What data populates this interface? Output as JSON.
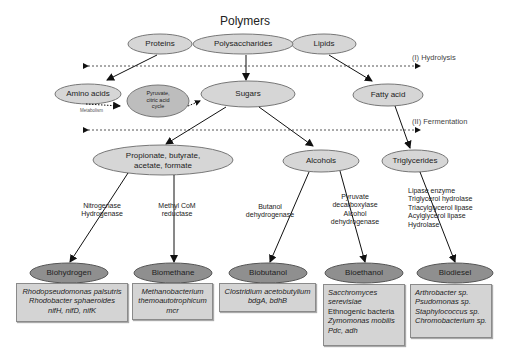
{
  "title": "Polymers",
  "polymers": {
    "proteins": "Proteins",
    "polysaccharides": "Polysaccharides",
    "lipids": "Lipids"
  },
  "stages": {
    "hydrolysis": "(I) Hydrolysis",
    "fermentation": "(II) Fermentation"
  },
  "intermediates": {
    "amino_acids": "Amino acids",
    "pyruvate": [
      "Pyruvate,",
      "citric acid",
      "cycle"
    ],
    "metabolism": "Metabolism",
    "sugars": "Sugars",
    "fatty_acid": "Fatty acid",
    "acids": [
      "Propionate, butyrate,",
      "acetate, formate"
    ],
    "alcohols": "Alcohols",
    "triglycerides": "Triglycerides"
  },
  "enzymes": {
    "biohydrogen": [
      "Nitrogenase",
      "Hydrogenase"
    ],
    "biomethane": [
      "Methyl CoM",
      "reductase"
    ],
    "biobutanol": [
      "Butanol",
      "dehydrogenase"
    ],
    "bioethanol": [
      "Pyruvate",
      "decarboxylase",
      "Alcohol",
      "dehydrogenase"
    ],
    "biodiesel": [
      "Lipase enzyme",
      "Triglycerol hydrolase",
      "Triacylglycerol lipase",
      "Acylglycerol lipase",
      "Hydrolase"
    ]
  },
  "products": [
    "Biohydrogen",
    "Biomethane",
    "Biobutanol",
    "Bioethanol",
    "Biodiesel"
  ],
  "organisms": {
    "biohydrogen": [
      {
        "text": "Rhodopseudomonas palsutris",
        "italic": true
      },
      {
        "text": "Rhodobacter sphaeroides",
        "italic": true
      },
      {
        "text": "nifH, nifD, nifK",
        "italic": true
      }
    ],
    "biomethane": [
      {
        "text": "Methanobacterium",
        "italic": true
      },
      {
        "text": "themoautotrophicum",
        "italic": true
      },
      {
        "text": "mcr",
        "italic": true
      }
    ],
    "biobutanol": [
      {
        "text": "Clostridium acetobutylium",
        "italic": true
      },
      {
        "text": "bdgA, bdhB",
        "italic": true
      }
    ],
    "bioethanol": [
      {
        "text": "Sacchromyces",
        "italic": true
      },
      {
        "text": "serevisiae",
        "italic": true
      },
      {
        "text": "Ethnogenic bacteria",
        "italic": false
      },
      {
        "text": "Zymomonas mobilis",
        "italic": true
      },
      {
        "text": "Pdc, adh",
        "italic": true
      }
    ],
    "biodiesel": [
      {
        "text": "Arthrobacter sp.",
        "italic": true
      },
      {
        "text": "Psudomonas sp.",
        "italic": true
      },
      {
        "text": "Staphylococcus sp.",
        "italic": true
      },
      {
        "text": "Chromobacterium sp.",
        "italic": true
      }
    ]
  },
  "colors": {
    "ellipse_light": "#d6d6d6",
    "ellipse_dark": "#8f8f8f",
    "box": "#d4d4d4",
    "stroke": "#555555"
  }
}
